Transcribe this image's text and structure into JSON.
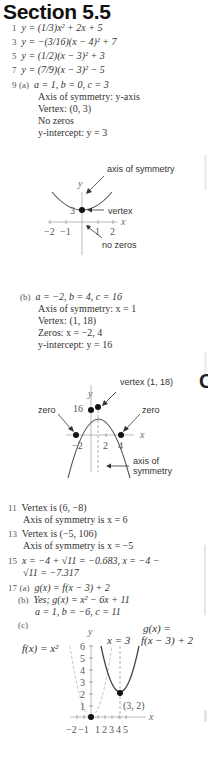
{
  "header": {
    "title": "Section 5.5"
  },
  "answers": {
    "a1": {
      "num": "1",
      "text": "y = (1/3)x² + 2x + 5"
    },
    "a3": {
      "num": "3",
      "text": "y = −(3/16)(x − 4)² + 7"
    },
    "a5": {
      "num": "5",
      "text": "y = (1/2)(x − 3)² + 3"
    },
    "a7": {
      "num": "7",
      "text": "y = (7/9)(x − 3)² − 5"
    },
    "a9": {
      "num": "9",
      "a": {
        "label": "(a)",
        "coeffs": "a = 1, b = 0, c = 3",
        "axis": "Axis of symmetry: y-axis",
        "vertex": "Vertex: (0, 3)",
        "zeros": "No zeros",
        "yint": "y-intercept: y = 3",
        "graph": {
          "y_label": "y",
          "x_label": "x",
          "y_tick": "3",
          "x_ticks": [
            "−2",
            "−1",
            "1",
            "2"
          ],
          "annot_axis": "axis of symmetry",
          "annot_vertex": "vertex",
          "annot_zeros": "no zeros"
        }
      },
      "b": {
        "label": "(b)",
        "coeffs": "a = −2, b = 4, c = 16",
        "axis": "Axis of symmetry: x = 1",
        "vertex": "Vertex: (1, 18)",
        "zeros": "Zeros: x = −2, 4",
        "yint": "y-intercept: y = 16",
        "graph": {
          "y_label": "y",
          "x_label": "x",
          "y_tick": "16",
          "x_ticks": [
            "−2",
            "2",
            "4"
          ],
          "annot_vertex": "vertex (1, 18)",
          "annot_zero_left": "zero",
          "annot_zero_right": "zero",
          "annot_axis_1": "axis of",
          "annot_axis_2": "symmetry"
        }
      }
    },
    "a11": {
      "num": "11",
      "line1": "Vertex is (6, −8)",
      "line2": "Axis of symmetry is x = 6"
    },
    "a13": {
      "num": "13",
      "line1": "Vertex is (−5, 106)",
      "line2": "Axis of symmetry is x = −5"
    },
    "a15": {
      "num": "15",
      "line1": "x = −4 + √11 = −0.683, x = −4 −",
      "line2": "√11 = −7.317"
    },
    "a17": {
      "num": "17",
      "a": {
        "label": "(a)",
        "text": "g(x) = f(x − 3) + 2"
      },
      "b": {
        "label": "(b)",
        "text": "Yes; g(x) = x² − 6x + 11",
        "coeffs": "a = 1, b = −6, c = 11"
      },
      "c": {
        "label": "(c)",
        "graph": {
          "y_label": "y",
          "x_label": "x",
          "y_ticks": [
            "1",
            "2",
            "3",
            "4",
            "5",
            "6"
          ],
          "x_ticks": [
            "−2",
            "−1",
            "1",
            "2",
            "3",
            "4",
            "5"
          ],
          "f_label": "f(x) = x²",
          "axis_label": "x = 3",
          "g_label_1": "g(x) =",
          "g_label_2": "f(x − 3) + 2",
          "point_label": "(3, 2)"
        }
      }
    }
  },
  "right_edge": {
    "section_letter": "C"
  }
}
